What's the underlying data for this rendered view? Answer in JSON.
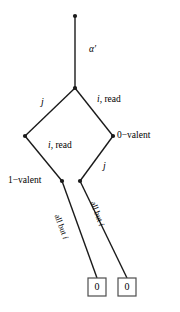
{
  "diagram": {
    "colors": {
      "line": "#1a1a1a",
      "text": "#000000",
      "background": "#ffffff",
      "box_border": "#4d4d4d"
    },
    "edge_labels": {
      "alpha_prime": "α′",
      "j_upper_left": "j",
      "i_read_upper_right": "read",
      "i_read_lower_left": "read",
      "j_lower_right": "j",
      "i_prefix": "i,",
      "all_but_i_left": "all but",
      "all_but_i_right": "all but",
      "all_but_i_suffix": "i"
    },
    "node_labels": {
      "zero_valent": "0−valent",
      "one_valent": "1−valent"
    },
    "terminals": [
      {
        "value": "0"
      },
      {
        "value": "0"
      }
    ],
    "nodes": [
      {
        "name": "root",
        "x": 75,
        "y": 16
      },
      {
        "name": "branch",
        "x": 75,
        "y": 88
      },
      {
        "name": "left",
        "x": 25,
        "y": 136
      },
      {
        "name": "right",
        "x": 113,
        "y": 136
      },
      {
        "name": "bottom-left",
        "x": 62,
        "y": 181
      },
      {
        "name": "bottom-right",
        "x": 80,
        "y": 181
      }
    ]
  }
}
